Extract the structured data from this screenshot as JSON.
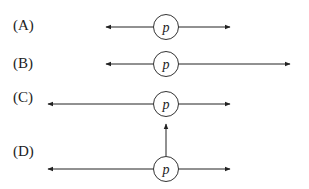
{
  "options": [
    {
      "label": "(A)",
      "node": "p",
      "description": "left arrow short, right arrow short"
    },
    {
      "label": "(B)",
      "node": "p",
      "description": "left arrow short, right arrow long"
    },
    {
      "label": "(C)",
      "node": "p",
      "description": "left arrow long, right arrow short"
    },
    {
      "label": "(D)",
      "node": "p",
      "description": "left arrow long, right arrow short, upward arrow"
    }
  ],
  "colors": {
    "stroke": "#222222",
    "background": "#ffffff"
  }
}
